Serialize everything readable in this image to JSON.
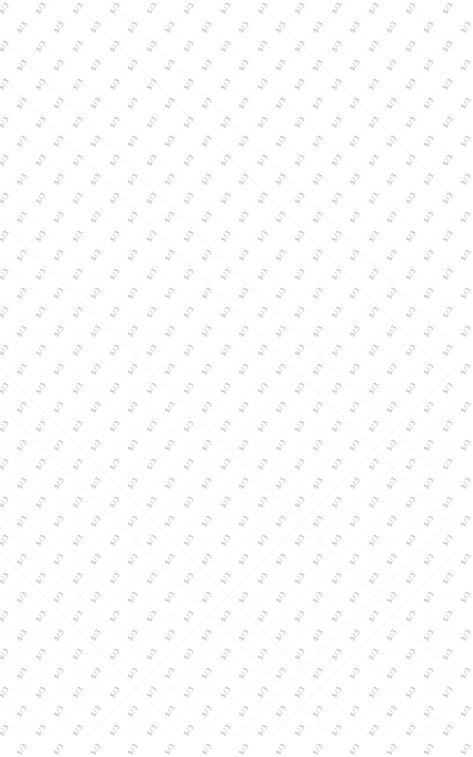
{
  "page": {
    "background": "#ffffff",
    "watermark": {
      "text": "$/3",
      "color": "#b8b8b8",
      "rotation_deg": -55,
      "col_spacing": 37,
      "row_spacing": 19,
      "row_offset": 18.5,
      "origin_x": 22,
      "origin_y": 28
    }
  }
}
